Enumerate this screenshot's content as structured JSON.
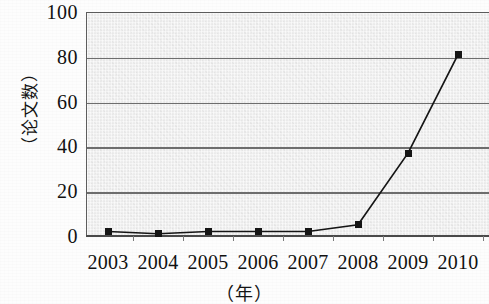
{
  "chart_data": {
    "type": "line",
    "title": "",
    "xlabel": "（年）",
    "ylabel": "（论文数）",
    "categories": [
      "2003",
      "2004",
      "2005",
      "2006",
      "2007",
      "2008",
      "2009",
      "2010"
    ],
    "values": [
      2,
      1,
      2,
      2,
      2,
      5,
      37,
      81
    ],
    "series": [
      {
        "name": "论文数",
        "values": [
          2,
          1,
          2,
          2,
          2,
          5,
          37,
          81
        ]
      }
    ],
    "ylim": [
      0,
      100
    ],
    "ytick_labels": [
      "100",
      "80",
      "60",
      "40",
      "20",
      "0"
    ],
    "ytick_values": [
      100,
      80,
      60,
      40,
      20,
      0
    ],
    "grid": "horizontal",
    "legend": "none",
    "marker_shape": "square",
    "colors": {
      "line": "#151515",
      "marker": "#151515",
      "plot_background": "#ededed",
      "gridline": "#6e6e6e",
      "axis": "#4a4a4a",
      "page_background": "#fdfdfd",
      "text": "#111111"
    }
  }
}
